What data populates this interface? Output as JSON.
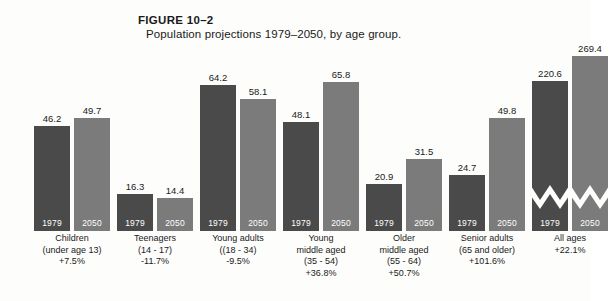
{
  "figure": {
    "number": "FIGURE 10–2",
    "caption": "Population projections 1979–2050, by age group."
  },
  "legend": {
    "series_1_label": "1979",
    "series_2_label": "2050",
    "series_1_color": "#4a4a4a",
    "series_2_color": "#7b7b7b"
  },
  "chart_data": {
    "type": "bar",
    "title": "Population projections 1979–2050, by age group.",
    "figure_number": "FIGURE 10–2",
    "xlabel": "",
    "ylabel": "",
    "grid": false,
    "legend_position": "in-bar",
    "axis_break": {
      "present": true,
      "applies_to_category": "All ages",
      "note": "zigzag scale break drawn across both All ages bars"
    },
    "categories": [
      "Children",
      "Teenagers",
      "Young adults",
      "Young middle aged",
      "Older middle aged",
      "Senior adults",
      "All ages"
    ],
    "category_details": [
      {
        "name": "Children",
        "line1": "Children",
        "line2": "(under age 13)",
        "line3": "+7.5%",
        "change": "+7.5%"
      },
      {
        "name": "Teenagers",
        "line1": "Teenagers",
        "line2": "(14 - 17)",
        "line3": "-11.7%",
        "change": "-11.7%"
      },
      {
        "name": "Young adults",
        "line1": "Young adults",
        "line2": "((18 - 34)",
        "line3": "-9.5%",
        "change": "-9.5%"
      },
      {
        "name": "Young middle aged",
        "line1": "Young",
        "line2": "middle aged",
        "line3": "(35 - 54)",
        "line4": "+36.8%",
        "change": "+36.8%"
      },
      {
        "name": "Older middle aged",
        "line1": "Older",
        "line2": "middle aged",
        "line3": "(55 - 64)",
        "line4": "+50.7%",
        "change": "+50.7%"
      },
      {
        "name": "Senior adults",
        "line1": "Senior adults",
        "line2": "(65 and older)",
        "line3": "+101.6%",
        "change": "+101.6%"
      },
      {
        "name": "All ages",
        "line1": "All ages",
        "line2": "+22.1%",
        "change": "+22.1%"
      }
    ],
    "series": [
      {
        "name": "1979",
        "color": "#4a4a4a",
        "values": [
          46.2,
          16.3,
          64.2,
          48.1,
          20.9,
          24.7,
          220.6
        ]
      },
      {
        "name": "2050",
        "color": "#7b7b7b",
        "values": [
          49.7,
          14.4,
          58.1,
          65.8,
          31.5,
          49.8,
          269.4
        ]
      }
    ],
    "value_labels": {
      "children": {
        "y1979": "46.2",
        "y2050": "49.7"
      },
      "teenagers": {
        "y1979": "16.3",
        "y2050": "14.4"
      },
      "young_adults": {
        "y1979": "64.2",
        "y2050": "58.1"
      },
      "young_middle_aged": {
        "y1979": "48.1",
        "y2050": "65.8"
      },
      "older_middle_aged": {
        "y1979": "20.9",
        "y2050": "31.5"
      },
      "senior_adults": {
        "y1979": "24.7",
        "y2050": "49.8"
      },
      "all_ages": {
        "y1979": "220.6",
        "y2050": "269.4"
      }
    },
    "units": "millions of people",
    "ylim": [
      0,
      70
    ]
  }
}
